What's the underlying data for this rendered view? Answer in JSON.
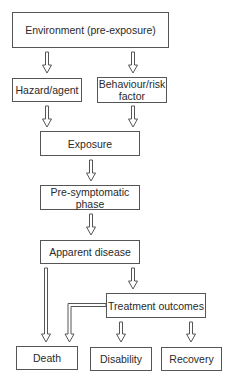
{
  "diagram": {
    "type": "flowchart",
    "nodes": {
      "environment": "Environment (pre-exposure)",
      "hazard": "Hazard/agent",
      "behaviour": "Behaviour/risk factor",
      "exposure": "Exposure",
      "presymptomatic": "Pre-symptomatic phase",
      "apparent": "Apparent disease",
      "treatment": "Treatment outcomes",
      "death": "Death",
      "disability": "Disability",
      "recovery": "Recovery"
    },
    "edges": [
      [
        "environment",
        "hazard"
      ],
      [
        "environment",
        "behaviour"
      ],
      [
        "hazard",
        "exposure"
      ],
      [
        "behaviour",
        "exposure"
      ],
      [
        "exposure",
        "presymptomatic"
      ],
      [
        "presymptomatic",
        "apparent"
      ],
      [
        "apparent",
        "death"
      ],
      [
        "apparent",
        "treatment"
      ],
      [
        "treatment",
        "death"
      ],
      [
        "treatment",
        "disability"
      ],
      [
        "treatment",
        "recovery"
      ]
    ]
  }
}
